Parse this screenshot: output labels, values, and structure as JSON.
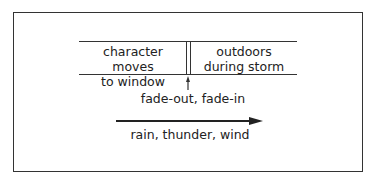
{
  "diagram": {
    "scenes": [
      {
        "label_line1": "character moves",
        "label_line2": "to window"
      },
      {
        "label_line1": "outdoors",
        "label_line2": "during storm"
      }
    ],
    "transition_label": "fade-out, fade-in",
    "sound_label": "rain, thunder, wind",
    "colors": {
      "line": "#333333",
      "text": "#222222",
      "background": "#ffffff"
    }
  }
}
